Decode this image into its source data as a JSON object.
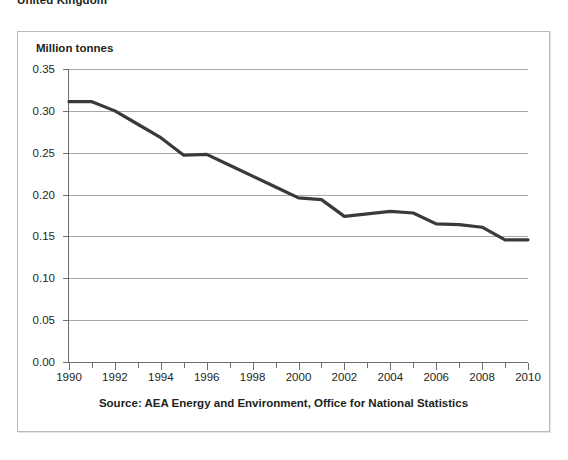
{
  "page_title": "United Kingdom",
  "chart_data": {
    "type": "line",
    "title": "",
    "subtitle": "",
    "ylabel": "Million tonnes",
    "xlabel": "",
    "source_note": "Source: AEA Energy and Environment, Office for National Statistics",
    "grid": true,
    "legend": "none",
    "xlim": [
      1990,
      2010
    ],
    "ylim": [
      0.0,
      0.35
    ],
    "ytick_labels": [
      "0.35",
      "0.30",
      "0.25",
      "0.20",
      "0.15",
      "0.10",
      "0.05",
      "0.00"
    ],
    "ytick_values": [
      0.35,
      0.3,
      0.25,
      0.2,
      0.15,
      0.1,
      0.05,
      0.0
    ],
    "xtick_labels": [
      "1990",
      "1992",
      "1994",
      "1996",
      "1998",
      "2000",
      "2002",
      "2004",
      "2006",
      "2008",
      "2010"
    ],
    "xtick_values": [
      1990,
      1992,
      1994,
      1996,
      1998,
      2000,
      2002,
      2004,
      2006,
      2008,
      2010
    ],
    "x_minor_ticks": [
      1991,
      1993,
      1995,
      1997,
      1999,
      2001,
      2003,
      2005,
      2007,
      2009
    ],
    "line_color": "#3a3a3a",
    "x": [
      1990,
      1991,
      1992,
      1993,
      1994,
      1995,
      1996,
      1997,
      1998,
      1999,
      2000,
      2001,
      2002,
      2003,
      2004,
      2005,
      2006,
      2007,
      2008,
      2009,
      2010
    ],
    "values": [
      0.311,
      0.311,
      0.3,
      0.284,
      0.268,
      0.247,
      0.248,
      0.235,
      0.222,
      0.209,
      0.196,
      0.194,
      0.174,
      0.177,
      0.18,
      0.178,
      0.165,
      0.164,
      0.161,
      0.146,
      0.146
    ],
    "series": [
      {
        "name": "Million tonnes",
        "values": [
          0.311,
          0.311,
          0.3,
          0.284,
          0.268,
          0.247,
          0.248,
          0.235,
          0.222,
          0.209,
          0.196,
          0.194,
          0.174,
          0.177,
          0.18,
          0.178,
          0.165,
          0.164,
          0.161,
          0.146,
          0.146
        ]
      }
    ]
  }
}
